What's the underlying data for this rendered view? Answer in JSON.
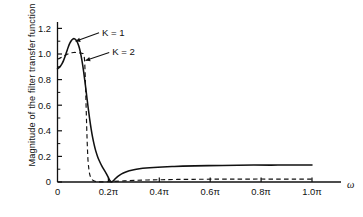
{
  "chart_data": {
    "type": "line",
    "title": "",
    "xlabel": "ω",
    "ylabel": "Magnitude of the filter transfer function",
    "xlim": [
      0,
      1.08
    ],
    "ylim": [
      0,
      1.25
    ],
    "xticks": [
      0,
      0.2,
      0.4,
      0.6,
      0.8,
      1.0
    ],
    "xticklabels": [
      "0",
      "0.2π",
      "0.4π",
      "0.6π",
      "0.8π",
      "1.0π"
    ],
    "yticks": [
      0,
      0.2,
      0.4,
      0.6,
      0.8,
      1.0,
      1.2
    ],
    "yticklabels": [
      "0",
      "0.2",
      "0.4",
      "0.6",
      "0.8",
      "1.0",
      "1.2"
    ],
    "grid": false,
    "legend_position": "inline-annotations",
    "annotations": [
      {
        "text": "K = 1",
        "x": 0.175,
        "y": 1.17,
        "points_to_x": 0.073,
        "points_to_y": 1.1
      },
      {
        "text": "K = 2",
        "x": 0.215,
        "y": 1.015,
        "points_to_x": 0.112,
        "points_to_y": 0.95
      }
    ],
    "series": [
      {
        "name": "K = 1",
        "style": "solid",
        "color": "#111111",
        "points": [
          [
            0.0,
            0.885
          ],
          [
            0.006,
            0.893
          ],
          [
            0.012,
            0.906
          ],
          [
            0.018,
            0.925
          ],
          [
            0.024,
            0.95
          ],
          [
            0.03,
            0.982
          ],
          [
            0.036,
            1.018
          ],
          [
            0.042,
            1.053
          ],
          [
            0.048,
            1.083
          ],
          [
            0.054,
            1.104
          ],
          [
            0.06,
            1.117
          ],
          [
            0.066,
            1.12
          ],
          [
            0.072,
            1.112
          ],
          [
            0.078,
            1.092
          ],
          [
            0.084,
            1.06
          ],
          [
            0.09,
            1.013
          ],
          [
            0.096,
            0.95
          ],
          [
            0.102,
            0.872
          ],
          [
            0.108,
            0.782
          ],
          [
            0.114,
            0.685
          ],
          [
            0.12,
            0.588
          ],
          [
            0.126,
            0.497
          ],
          [
            0.132,
            0.417
          ],
          [
            0.138,
            0.348
          ],
          [
            0.144,
            0.292
          ],
          [
            0.15,
            0.245
          ],
          [
            0.158,
            0.196
          ],
          [
            0.166,
            0.158
          ],
          [
            0.174,
            0.126
          ],
          [
            0.182,
            0.098
          ],
          [
            0.19,
            0.072
          ],
          [
            0.196,
            0.05
          ],
          [
            0.201,
            0.03
          ],
          [
            0.205,
            0.014
          ],
          [
            0.209,
            0.004
          ],
          [
            0.212,
            0.0
          ],
          [
            0.216,
            0.004
          ],
          [
            0.222,
            0.015
          ],
          [
            0.23,
            0.031
          ],
          [
            0.24,
            0.048
          ],
          [
            0.252,
            0.063
          ],
          [
            0.266,
            0.076
          ],
          [
            0.282,
            0.087
          ],
          [
            0.3,
            0.096
          ],
          [
            0.322,
            0.103
          ],
          [
            0.348,
            0.109
          ],
          [
            0.378,
            0.114
          ],
          [
            0.412,
            0.118
          ],
          [
            0.45,
            0.121
          ],
          [
            0.492,
            0.124
          ],
          [
            0.54,
            0.126
          ],
          [
            0.592,
            0.128
          ],
          [
            0.648,
            0.129
          ],
          [
            0.708,
            0.131
          ],
          [
            0.772,
            0.132
          ],
          [
            0.84,
            0.132
          ],
          [
            0.91,
            0.133
          ],
          [
            0.96,
            0.133
          ],
          [
            1.0,
            0.133
          ]
        ]
      },
      {
        "name": "K = 2",
        "style": "dashed",
        "color": "#111111",
        "points": [
          [
            0.0,
            0.96
          ],
          [
            0.008,
            0.966
          ],
          [
            0.016,
            0.974
          ],
          [
            0.024,
            0.983
          ],
          [
            0.032,
            0.992
          ],
          [
            0.04,
            1.0
          ],
          [
            0.048,
            1.006
          ],
          [
            0.056,
            1.01
          ],
          [
            0.064,
            1.012
          ],
          [
            0.072,
            1.012
          ],
          [
            0.08,
            1.01
          ],
          [
            0.088,
            1.008
          ],
          [
            0.094,
            1.006
          ],
          [
            0.099,
            1.004
          ],
          [
            0.103,
            0.995
          ],
          [
            0.106,
            0.96
          ],
          [
            0.108,
            0.88
          ],
          [
            0.11,
            0.76
          ],
          [
            0.112,
            0.62
          ],
          [
            0.114,
            0.48
          ],
          [
            0.116,
            0.35
          ],
          [
            0.118,
            0.245
          ],
          [
            0.12,
            0.165
          ],
          [
            0.123,
            0.105
          ],
          [
            0.126,
            0.065
          ],
          [
            0.13,
            0.038
          ],
          [
            0.135,
            0.021
          ],
          [
            0.141,
            0.011
          ],
          [
            0.148,
            0.005
          ],
          [
            0.158,
            0.002
          ],
          [
            0.172,
            0.001
          ],
          [
            0.195,
            0.002
          ],
          [
            0.225,
            0.005
          ],
          [
            0.262,
            0.009
          ],
          [
            0.305,
            0.013
          ],
          [
            0.355,
            0.016
          ],
          [
            0.41,
            0.018
          ],
          [
            0.47,
            0.02
          ],
          [
            0.535,
            0.021
          ],
          [
            0.605,
            0.022
          ],
          [
            0.68,
            0.022
          ],
          [
            0.76,
            0.023
          ],
          [
            0.845,
            0.023
          ],
          [
            0.93,
            0.023
          ],
          [
            1.0,
            0.023
          ]
        ]
      }
    ]
  }
}
